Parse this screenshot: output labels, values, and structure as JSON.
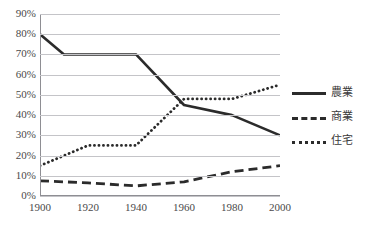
{
  "chart_data": {
    "type": "line",
    "title": "",
    "xlabel": "",
    "ylabel": "",
    "x": [
      1900,
      1920,
      1940,
      1960,
      1980,
      2000
    ],
    "categories": [
      "1900",
      "1920",
      "1940",
      "1960",
      "1980",
      "2000"
    ],
    "xlim": [
      1900,
      2000
    ],
    "ylim": [
      0,
      90
    ],
    "ytick_labels": [
      "0%",
      "10%",
      "20%",
      "30%",
      "40%",
      "50%",
      "60%",
      "70%",
      "80%",
      "90%"
    ],
    "ytick_values": [
      0,
      10,
      20,
      30,
      40,
      50,
      60,
      70,
      80,
      90
    ],
    "grid": true,
    "legend_position": "right",
    "series": [
      {
        "name": "農業",
        "style": "solid",
        "color": "#2b2b2b",
        "values": [
          80,
          70,
          70,
          45,
          40,
          30
        ],
        "vertices": [
          {
            "x": 1900,
            "y": 80
          },
          {
            "x": 1910,
            "y": 70
          },
          {
            "x": 1920,
            "y": 70
          },
          {
            "x": 1940,
            "y": 70
          },
          {
            "x": 1960,
            "y": 45
          },
          {
            "x": 1980,
            "y": 40
          },
          {
            "x": 2000,
            "y": 30
          }
        ]
      },
      {
        "name": "商業",
        "style": "dashed",
        "color": "#2b2b2b",
        "values": [
          7.5,
          6.5,
          5,
          7,
          12,
          15
        ],
        "vertices": [
          {
            "x": 1900,
            "y": 7.5
          },
          {
            "x": 1920,
            "y": 6.5
          },
          {
            "x": 1940,
            "y": 5
          },
          {
            "x": 1960,
            "y": 7
          },
          {
            "x": 1980,
            "y": 12
          },
          {
            "x": 2000,
            "y": 15
          }
        ]
      },
      {
        "name": "住宅",
        "style": "dotted",
        "color": "#2b2b2b",
        "values": [
          15,
          25,
          25,
          48,
          48,
          55
        ],
        "vertices": [
          {
            "x": 1900,
            "y": 15
          },
          {
            "x": 1920,
            "y": 25
          },
          {
            "x": 1940,
            "y": 25
          },
          {
            "x": 1960,
            "y": 48
          },
          {
            "x": 1980,
            "y": 48
          },
          {
            "x": 2000,
            "y": 55
          }
        ]
      }
    ]
  },
  "legend": {
    "items": [
      {
        "label": "農業",
        "style": "solid"
      },
      {
        "label": "商業",
        "style": "dashed"
      },
      {
        "label": "住宅",
        "style": "dotted"
      }
    ]
  },
  "axes": {
    "y_labels": [
      "90%",
      "80%",
      "70%",
      "60%",
      "50%",
      "40%",
      "30%",
      "20%",
      "10%",
      "0%"
    ],
    "x_labels": [
      "1900",
      "1920",
      "1940",
      "1960",
      "1980",
      "2000"
    ]
  },
  "title_fragment": ""
}
